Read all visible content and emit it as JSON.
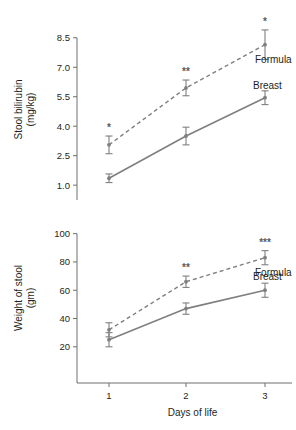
{
  "figure": {
    "background_color": "#ffffff",
    "line_color": "#7f7f7f",
    "axis_color": "#6e6e6e",
    "text_color": "#231f20"
  },
  "chart_data": [
    {
      "type": "line",
      "panel": "top",
      "title": "",
      "xlabel": "",
      "ylabel": "Stool bilirubin\n(mg/kg)",
      "ylabel_line1": "Stool bilirubin",
      "ylabel_line2": "(mg/kg)",
      "x": [
        1,
        2,
        3
      ],
      "categories": [
        "1",
        "2",
        "3"
      ],
      "xtick_labels": [
        "1",
        "2",
        "3"
      ],
      "ytick_labels": [
        "1.0",
        "2.5",
        "4.0",
        "5.5",
        "7.0",
        "8.5"
      ],
      "yticks": [
        1.0,
        2.5,
        4.0,
        5.5,
        7.0,
        8.5
      ],
      "ylim": [
        0.6,
        9.1
      ],
      "xlim": [
        0.55,
        3.45
      ],
      "grid": false,
      "legend_position": "inline-right",
      "series": [
        {
          "name": "Formula",
          "label": "Formula",
          "linestyle": "dashed",
          "values": [
            3.05,
            5.95,
            8.15
          ],
          "errors": [
            0.45,
            0.4,
            0.75
          ],
          "annotations": [
            "*",
            "**",
            "*"
          ]
        },
        {
          "name": "Breast",
          "label": "Breast",
          "linestyle": "solid",
          "values": [
            1.35,
            3.5,
            5.45
          ],
          "errors": [
            0.22,
            0.45,
            0.35
          ],
          "annotations": [
            "",
            "",
            ""
          ]
        }
      ]
    },
    {
      "type": "line",
      "panel": "bottom",
      "title": "",
      "xlabel": "Days of life",
      "ylabel": "Weight of stool\n(gm)",
      "ylabel_line1": "Weight of stool",
      "ylabel_line2": "(gm)",
      "x": [
        1,
        2,
        3
      ],
      "categories": [
        "1",
        "2",
        "3"
      ],
      "xtick_labels": [
        "1",
        "2",
        "3"
      ],
      "ytick_labels": [
        "20",
        "40",
        "60",
        "80",
        "100"
      ],
      "yticks": [
        20,
        40,
        60,
        80,
        100
      ],
      "ylim": [
        5,
        104
      ],
      "xlim": [
        0.55,
        3.45
      ],
      "grid": false,
      "legend_position": "inline-right",
      "series": [
        {
          "name": "Formula",
          "label": "Formula",
          "linestyle": "dashed",
          "values": [
            32,
            66,
            83
          ],
          "errors": [
            5,
            4,
            5
          ],
          "annotations": [
            "",
            "**",
            "***"
          ]
        },
        {
          "name": "Breast",
          "label": "Breast",
          "linestyle": "solid",
          "values": [
            25,
            47,
            60
          ],
          "errors": [
            5,
            4,
            5
          ],
          "annotations": [
            "",
            "",
            ""
          ]
        }
      ]
    }
  ]
}
